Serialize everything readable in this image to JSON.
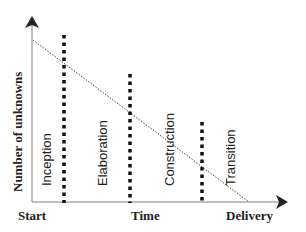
{
  "diagram": {
    "y_axis_label": "Number of unknowns",
    "x_axis_labels": {
      "start": "Start",
      "middle": "Time",
      "end": "Delivery"
    },
    "phases": [
      {
        "label": "Inception"
      },
      {
        "label": "Elaboration"
      },
      {
        "label": "Construction"
      },
      {
        "label": "Transition"
      }
    ],
    "trend_line": {
      "style": "dotted",
      "description": "Unknowns decrease linearly from start to delivery"
    },
    "colors": {
      "axis": "#aaaaaa",
      "arrow": "#222222",
      "phase_divider": "#111111",
      "trend_line": "#444444",
      "text": "#222222"
    }
  }
}
